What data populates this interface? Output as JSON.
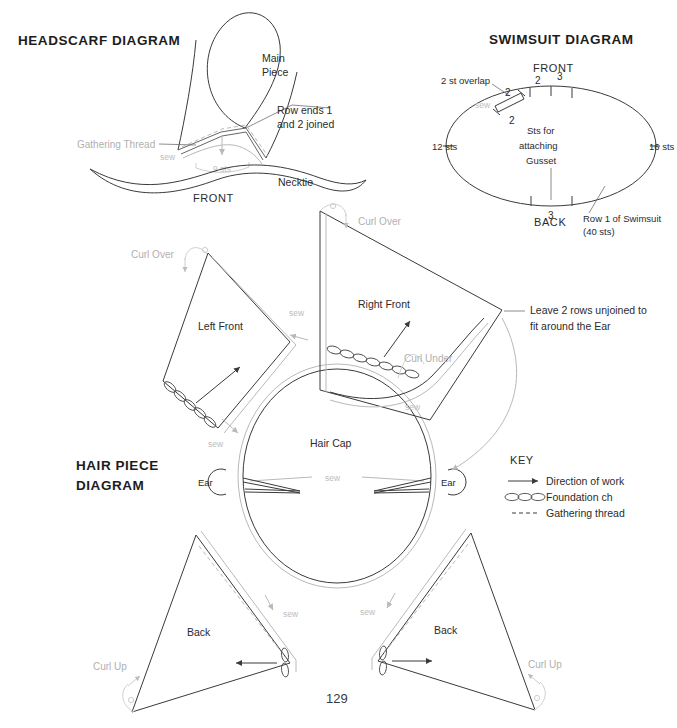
{
  "page": {
    "number": "129",
    "background_color": "#ffffff",
    "ink_color": "#3a3a3a",
    "grey_color": "#b9b9b9"
  },
  "headscarf": {
    "title": "HEADSCARF DIAGRAM",
    "labels": {
      "main_piece_line1": "Main",
      "main_piece_line2": "Piece",
      "row_ends_line1": "Row ends 1",
      "row_ends_line2": "and 2 joined",
      "gathering_thread": "Gathering Thread",
      "sew": "sew",
      "sts": "9 sts",
      "necktie": "Necktie",
      "front": "FRONT"
    }
  },
  "swimsuit": {
    "title": "SWIMSUIT DIAGRAM",
    "labels": {
      "front": "FRONT",
      "back": "BACK",
      "overlap": "2 st overlap",
      "sew": "sew",
      "left_sts": "12 sts",
      "right_sts": "16 sts",
      "gusset_line1": "Sts for",
      "gusset_line2": "attaching",
      "gusset_line3": "Gusset",
      "row1_line1": "Row 1 of Swimsuit",
      "row1_line2": "(40 sts)"
    },
    "tick_numbers": {
      "overlap_top": "2",
      "overlap_bottom": "2",
      "front_two": "2",
      "front_three": "3",
      "back_three": "3"
    }
  },
  "hairpiece": {
    "title_line1": "HAIR PIECE",
    "title_line2": "DIAGRAM",
    "pieces": {
      "left_front": "Left Front",
      "right_front": "Right Front",
      "hair_cap": "Hair Cap",
      "back_left": "Back",
      "back_right": "Back",
      "ear_left": "Ear",
      "ear_right": "Ear"
    },
    "annotations": {
      "curl_over_left": "Curl Over",
      "curl_over_right": "Curl Over",
      "curl_under": "Curl Under",
      "curl_up_left": "Curl Up",
      "curl_up_right": "Curl Up",
      "leave_rows_line1": "Leave 2 rows unjoined to",
      "leave_rows_line2": "fit around the Ear",
      "sew": "sew"
    }
  },
  "key": {
    "heading": "KEY",
    "items": [
      {
        "icon": "arrow-right-icon",
        "label": "Direction of work"
      },
      {
        "icon": "chain-ovals-icon",
        "label": "Foundation ch"
      },
      {
        "icon": "dashed-line-icon",
        "label": "Gathering thread"
      }
    ]
  }
}
